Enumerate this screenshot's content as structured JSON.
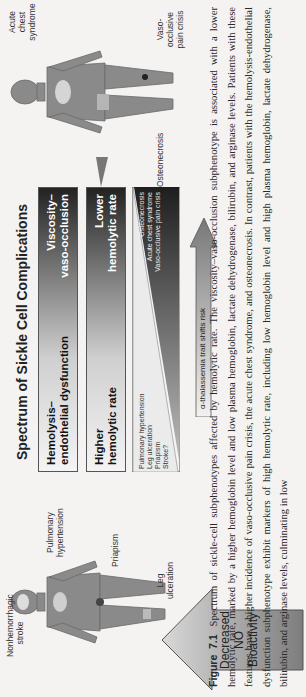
{
  "figure": {
    "title": "Spectrum of Sickle Cell Complications",
    "bars": [
      {
        "left": "Hemolysis–\nendothelial dysfunction",
        "right": "Viscosity–\nvaso-occlusion"
      },
      {
        "left": "Higher\nhemolytic rate",
        "right": "Lower\nhemolytic rate"
      }
    ],
    "wedge": {
      "left_items": "Pulmonary hypertension\nLeg ulceration\nPriapism\nStroke?",
      "right_items": "Osteonecrosis\nAcute chest syndrome\nVaso-occlusive pain crisis"
    },
    "alpha_arrow": "α-thalassemia trait shifts risk",
    "no_arrow": "Decreased\nNO\nBioactivity",
    "left_body_labels": {
      "stroke": "Nonhemorrhagic\nstroke",
      "pulm": "Pulmonary\nhypertension",
      "priapism": "Priapism",
      "leg": "Leg\nulceration"
    },
    "right_body_labels": {
      "acs": "Acute chest\nsyndrome",
      "osteo": "Osteonecrosis",
      "voc": "Vaso-occlusive\npain crisis"
    },
    "colors": {
      "bar_dark": "#222222",
      "bar_light": "#f4f4f4",
      "body_gray": "#8a8a8a",
      "page": "#f4f3f1"
    }
  },
  "caption": {
    "label": "Figure 7.1",
    "text": "Spectrum of sickle-cell subphenotypes affected by hemolytic rate. The viscosity–vaso-occlusion subphenotype is associated with a lower hemolytic rate, marked by a higher hemoglobin level and low plasma hemoglobin, lactate dehydrogenase, bilirubin, and arginase levels. Patients with these features have a higher incidence of vaso-occlusive pain crisis, the acute chest syndrome, and osteonecrosis. In contrast, patients with the hemolysis-endothelial dysfunction subphenotype exhibit markers of high hemolytic rate, including low hemoglobin level and high plasma hemoglobin, lactate dehydrogenase, bilirubin, and arginase levels, culminating in low"
  }
}
